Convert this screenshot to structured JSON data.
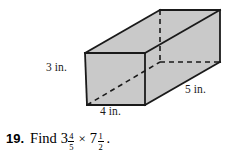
{
  "figure": {
    "name": "rectangular-prism",
    "shape_type": "rectangular prism",
    "fill_color": "#c9c9c9",
    "edge_color": "#1a1a1a",
    "hidden_edge_style": "dashed",
    "labels": {
      "height": "3 in.",
      "width": "4 in.",
      "depth": "5 in."
    }
  },
  "problem": {
    "number": "19.",
    "verb": "Find",
    "operator": "×",
    "period": ".",
    "first_term": {
      "whole": "3",
      "numerator": "4",
      "denominator": "5"
    },
    "second_term": {
      "whole": "7",
      "numerator": "1",
      "denominator": "2"
    }
  }
}
